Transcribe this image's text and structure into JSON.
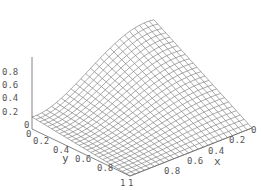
{
  "chart_data": {
    "type": "surface3d",
    "title": "",
    "xlabel": "x",
    "ylabel": "y",
    "zlabel": "",
    "x_range": [
      0,
      1
    ],
    "y_range": [
      0,
      1
    ],
    "z_range": [
      0,
      0.9
    ],
    "x_ticks": [
      "0",
      "0.2",
      "0.4",
      "0.6",
      "0.8",
      "1"
    ],
    "y_ticks": [
      "0",
      "0.2",
      "0.4",
      "0.6",
      "0.8",
      "1"
    ],
    "z_ticks": [
      "0",
      "0.2",
      "0.4",
      "0.6",
      "0.8"
    ],
    "grid_lines_per_axis": 25,
    "mesh_color": "#707070",
    "box_color": "#666666",
    "corner_values": {
      "x0_y0": 0.15,
      "x1_y1": 0.0,
      "x0_y1": 0.0,
      "x1_y0_peak": 0.9
    }
  },
  "labels": {
    "x_axis": "x",
    "y_axis": "y",
    "z_ticks": [
      "0.8",
      "0.6",
      "0.4",
      "0.2",
      "0"
    ],
    "y_ticks": [
      "0",
      "0.2",
      "0.4",
      "0.6",
      "0.8",
      "1"
    ],
    "x_ticks": [
      "1",
      "0.8",
      "0.6",
      "0.4",
      "0.2",
      "0"
    ]
  }
}
